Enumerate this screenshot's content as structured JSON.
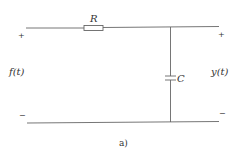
{
  "diagram": {
    "type": "RC circuit",
    "caption": "a)",
    "components": {
      "resistor": {
        "label": "R"
      },
      "capacitor": {
        "label": "C"
      }
    },
    "ports": {
      "input": {
        "label": "f(t)",
        "plus": "+",
        "minus": "−"
      },
      "output": {
        "label": "y(t)",
        "plus": "+",
        "minus": "−"
      }
    },
    "colors": {
      "line": "#666666",
      "text": "#333333",
      "background": "#ffffff"
    }
  }
}
